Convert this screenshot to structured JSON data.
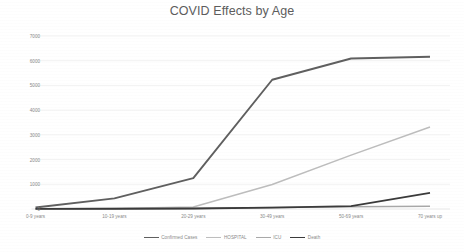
{
  "chart": {
    "title": "COVID Effects by Age",
    "legend_items": [
      {
        "label": "Confirmed Cases",
        "color": "#5f5f5f"
      },
      {
        "label": "HOSPITAL",
        "color": "#bdbdbd"
      },
      {
        "label": "ICU",
        "color": "#a8a8a8"
      },
      {
        "label": "Death",
        "color": "#3a3a3a"
      }
    ]
  },
  "chart_data": {
    "type": "line",
    "title": "COVID Effects by Age",
    "xlabel": "",
    "ylabel": "",
    "categories": [
      "0-9 years",
      "10-19 years",
      "20-29 years",
      "30-49 years",
      "50-69 years",
      "70 years up"
    ],
    "ytick_labels": [
      "0",
      "1000",
      "2000",
      "3000",
      "4000",
      "5000",
      "6000",
      "7000"
    ],
    "ytick_values": [
      0,
      1000,
      2000,
      3000,
      4000,
      5000,
      6000,
      7000
    ],
    "ylim": [
      0,
      7000
    ],
    "grid": true,
    "legend_position": "bottom",
    "series": [
      {
        "name": "Confirmed Cases",
        "color": "#5f5f5f",
        "values": [
          60,
          430,
          1250,
          5230,
          6090,
          6160
        ]
      },
      {
        "name": "HOSPITAL",
        "color": "#bdbdbd",
        "values": [
          10,
          20,
          80,
          990,
          2180,
          3320
        ]
      },
      {
        "name": "ICU",
        "color": "#a8a8a8",
        "values": [
          5,
          10,
          25,
          60,
          90,
          110
        ]
      },
      {
        "name": "Death",
        "color": "#3a3a3a",
        "values": [
          5,
          10,
          20,
          55,
          120,
          650
        ]
      }
    ]
  }
}
